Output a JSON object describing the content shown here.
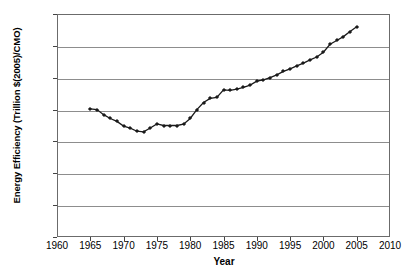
{
  "chart_data": {
    "type": "line",
    "title": "",
    "xlabel": "Year",
    "ylabel": "Energy Efficiency (Trillion $(2005)/CMO)",
    "xlim": [
      1960,
      2010
    ],
    "ylim": [
      0,
      70
    ],
    "xticks": [
      1960,
      1965,
      1970,
      1975,
      1980,
      1985,
      1990,
      1995,
      2000,
      2005,
      2010
    ],
    "yticks": [
      0,
      10,
      20,
      30,
      40,
      50,
      60,
      70
    ],
    "grid": "horizontal",
    "legend": "none",
    "marker": "diamond",
    "line_color": "#1a1a1a",
    "x": [
      1965,
      1966,
      1967,
      1968,
      1969,
      1970,
      1971,
      1972,
      1973,
      1974,
      1975,
      1976,
      1977,
      1978,
      1979,
      1980,
      1981,
      1982,
      1983,
      1984,
      1985,
      1986,
      1987,
      1988,
      1989,
      1990,
      1991,
      1992,
      1993,
      1994,
      1995,
      1996,
      1997,
      1998,
      1999,
      2000,
      2001,
      2002,
      2003,
      2004,
      2005
    ],
    "values": [
      40.2,
      40.0,
      38.4,
      37.2,
      36.3,
      34.8,
      34.2,
      33.2,
      33.0,
      34.2,
      35.5,
      35.0,
      35.0,
      35.0,
      35.4,
      37.2,
      40.0,
      42.2,
      43.5,
      43.8,
      46.2,
      46.0,
      46.4,
      47.0,
      47.7,
      48.9,
      49.3,
      50.0,
      50.9,
      52.0,
      52.8,
      53.7,
      54.6,
      55.6,
      56.5,
      58.0,
      60.5,
      61.7,
      62.9,
      64.5,
      66.0
    ]
  },
  "axes": {
    "y_title": "Energy Efficiency (Trillion $(2005)/CMO)",
    "x_title": "Year",
    "y_tick_labels": [
      "70",
      "60",
      "50",
      "40",
      "30",
      "20",
      "10",
      "0"
    ],
    "x_tick_labels": [
      "1960",
      "1965",
      "1970",
      "1975",
      "1980",
      "1985",
      "1990",
      "1995",
      "2000",
      "2005",
      "2010"
    ]
  }
}
